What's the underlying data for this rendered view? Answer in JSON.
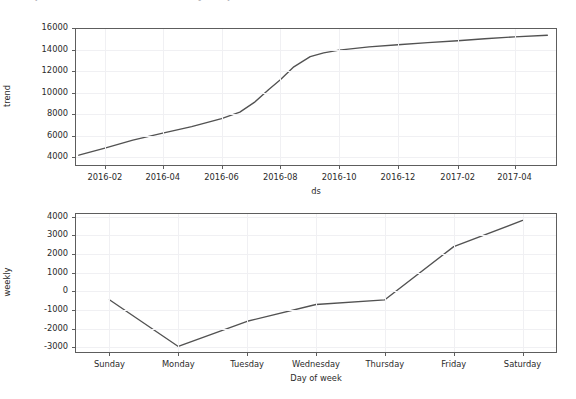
{
  "header": {
    "clipped_text": "Prophet forecast — trend and weekly components"
  },
  "figure": {
    "background_color": "#ffffff",
    "line_color": "#525252",
    "grid_color": "#f0f0f3",
    "axis_color": "#5d5d5d"
  },
  "chart_data": [
    {
      "type": "line",
      "title": "",
      "xlabel": "ds",
      "ylabel": "trend",
      "grid": true,
      "legend": "none",
      "ylim": [
        3200,
        16000
      ],
      "yticks": [
        4000,
        6000,
        8000,
        10000,
        12000,
        14000,
        16000
      ],
      "ytick_labels": [
        "4000",
        "6000",
        "8000",
        "10000",
        "12000",
        "14000",
        "16000"
      ],
      "xticks": [
        "2016-02",
        "2016-04",
        "2016-06",
        "2016-08",
        "2016-10",
        "2016-12",
        "2017-02",
        "2017-04"
      ],
      "xtick_labels": [
        "2016-02",
        "2016-04",
        "2016-06",
        "2016-08",
        "2016-10",
        "2016-12",
        "2017-02",
        "2017-04"
      ],
      "xlim": [
        "2016-01-01",
        "2017-05-15"
      ],
      "series": [
        {
          "name": "trend",
          "x": [
            "2016-01-05",
            "2016-02-01",
            "2016-03-01",
            "2016-04-01",
            "2016-05-01",
            "2016-06-01",
            "2016-06-20",
            "2016-07-05",
            "2016-07-20",
            "2016-08-01",
            "2016-08-15",
            "2016-09-01",
            "2016-09-15",
            "2016-10-01",
            "2016-11-01",
            "2016-12-01",
            "2017-01-01",
            "2017-02-01",
            "2017-03-01",
            "2017-04-01",
            "2017-05-05"
          ],
          "values": [
            4200,
            4850,
            5600,
            6250,
            6850,
            7600,
            8200,
            9100,
            10300,
            11200,
            12400,
            13350,
            13700,
            13950,
            14250,
            14450,
            14650,
            14820,
            15000,
            15180,
            15330
          ]
        }
      ]
    },
    {
      "type": "line",
      "title": "",
      "xlabel": "Day of week",
      "ylabel": "weekly",
      "grid": true,
      "legend": "none",
      "ylim": [
        -3300,
        4200
      ],
      "yticks": [
        -3000,
        -2000,
        -1000,
        0,
        1000,
        2000,
        3000,
        4000
      ],
      "ytick_labels": [
        "-3000",
        "-2000",
        "-1000",
        "0",
        "1000",
        "2000",
        "3000",
        "4000"
      ],
      "categories": [
        "Sunday",
        "Monday",
        "Tuesday",
        "Wednesday",
        "Thursday",
        "Friday",
        "Saturday"
      ],
      "series": [
        {
          "name": "weekly",
          "values": [
            -450,
            -2950,
            -1600,
            -700,
            -450,
            2400,
            3800
          ]
        }
      ]
    }
  ]
}
